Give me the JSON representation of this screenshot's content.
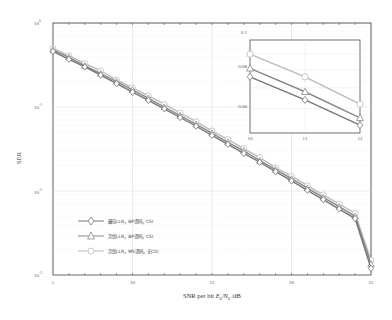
{
  "chart_data": {
    "type": "line",
    "title": "",
    "xlabel": "SNR per bit E_b/N_0 /dB",
    "ylabel": "SER",
    "yscale": "log",
    "xlim": [
      5,
      25
    ],
    "ylim": [
      0.001,
      1
    ],
    "x_ticks": [
      "5",
      "10",
      "15",
      "20",
      "25"
    ],
    "y_ticks": [
      "10^0",
      "10^-1",
      "10^-2",
      "10^-3"
    ],
    "grid": true,
    "legend_position": "lower left",
    "x": [
      5,
      6,
      7,
      8,
      9,
      10,
      11,
      12,
      13,
      14,
      15,
      16,
      17,
      18,
      19,
      20,
      21,
      22,
      23,
      24,
      25
    ],
    "series": [
      {
        "name": "最佳LLR，BP译码，CSI",
        "marker": "diamond",
        "color": "#777777",
        "values": [
          0.46,
          0.37,
          0.3,
          0.24,
          0.19,
          0.15,
          0.12,
          0.095,
          0.075,
          0.059,
          0.046,
          0.036,
          0.028,
          0.022,
          0.017,
          0.0132,
          0.0102,
          0.0079,
          0.0061,
          0.0047,
          0.0012
        ]
      },
      {
        "name": "次优LLR，BP译码，CSI",
        "marker": "triangle",
        "color": "#888888",
        "values": [
          0.48,
          0.39,
          0.31,
          0.25,
          0.2,
          0.16,
          0.127,
          0.1,
          0.079,
          0.062,
          0.049,
          0.038,
          0.03,
          0.023,
          0.018,
          0.014,
          0.0108,
          0.0084,
          0.0065,
          0.005,
          0.00135
        ]
      },
      {
        "name": "次优LLR，MS译码，无CSI",
        "marker": "circle",
        "color": "#bbbbbb",
        "values": [
          0.5,
          0.41,
          0.33,
          0.27,
          0.21,
          0.17,
          0.136,
          0.108,
          0.085,
          0.067,
          0.052,
          0.041,
          0.032,
          0.025,
          0.019,
          0.015,
          0.0116,
          0.009,
          0.007,
          0.0054,
          0.0015
        ]
      }
    ],
    "inset": {
      "xlim": [
        10,
        12
      ],
      "ylim": [
        0.05,
        0.1
      ],
      "x_ticks": [
        "10",
        "11",
        "12"
      ],
      "y_ticks": [
        "0.1",
        "0.08",
        "0.06"
      ],
      "x": [
        10,
        11,
        12
      ],
      "series": [
        {
          "name": "最佳LLR，BP译码，CSI",
          "values": [
            0.076,
            0.064,
            0.053
          ]
        },
        {
          "name": "次优LLR，BP译码，CSI",
          "values": [
            0.081,
            0.068,
            0.056
          ]
        },
        {
          "name": "次优LLR，MS译码，无CSI",
          "values": [
            0.09,
            0.076,
            0.062
          ]
        }
      ]
    }
  },
  "labels": {
    "xlabel_prefix": "SNR per bit ",
    "xlabel_E": "E",
    "xlabel_b": "b",
    "xlabel_slash": "/N",
    "xlabel_0": "0",
    "xlabel_suffix": " /dB",
    "ylabel": "SER",
    "xt5": "5",
    "xt10": "10",
    "xt15": "15",
    "xt20": "20",
    "xt25": "25",
    "yt_base": "10",
    "yt0": "0",
    "yt1": "-1",
    "yt2": "-2",
    "yt3": "-3",
    "leg1": "最佳LLR，BP译码，CSI",
    "leg2": "次优LLR，BP译码，CSI",
    "leg3": "次优LLR，MS译码，无CSI",
    "ixt10": "10",
    "ixt11": "11",
    "ixt12": "12",
    "iyt1": "0.1",
    "iyt2": "0.08",
    "iyt3": "0.06"
  }
}
